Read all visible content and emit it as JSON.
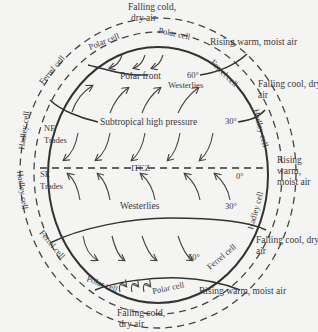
{
  "diagram": {
    "top_outer": {
      "line1": "Falling cold,",
      "line2": "dry air"
    },
    "bottom_outer": {
      "line1": "Falling cold,",
      "line2": "dry air"
    },
    "right_labels": {
      "rising_top": "Rising warm, moist air",
      "falling_top_1": "Falling cool, dry",
      "falling_top_2": "air",
      "rising_mid_1": "Rising",
      "rising_mid_2": "warm,",
      "rising_mid_3": "moist air",
      "falling_bot_1": "Falling cool, dry",
      "falling_bot_2": "air",
      "rising_bot": "Rising warm, moist air"
    },
    "cells": {
      "polar_tl": "Polar cell",
      "polar_tr": "Polar cell",
      "ferrel_tl": "Ferrel cell",
      "ferrel_tr": "Ferrel cell",
      "hadley_l1": "Hadley cell",
      "hadley_l2": "Hadley cell",
      "hadley_r1": "Hadley cell",
      "hadley_r2": "Hadley cell",
      "ferrel_bl": "Ferrel cell",
      "ferrel_br": "Ferrel cell",
      "polar_bl": "Polar cell",
      "polar_br": "Polar cell"
    },
    "inner": {
      "polar_front": "Polar front",
      "westerlies_n": "Westerlies",
      "subtropical": "Subtropical high pressure",
      "ne_trades_1": "NE",
      "ne_trades_2": "Trades",
      "se_trades_1": "SE",
      "se_trades_2": "Trades",
      "itcz": "ITCZ",
      "westerlies_s": "Westerlies"
    },
    "latitudes": {
      "n60": "60°",
      "n30": "30°",
      "eq": "0°",
      "s30": "30°",
      "s60": "60°"
    }
  }
}
